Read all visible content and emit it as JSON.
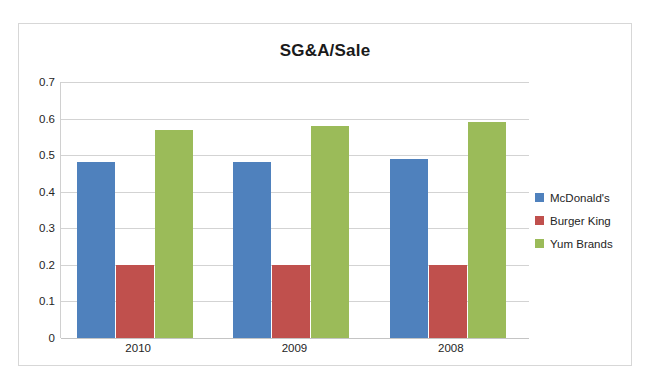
{
  "chart_data": {
    "type": "bar",
    "title": "SG&A/Sale",
    "xlabel": "",
    "ylabel": "",
    "categories": [
      "2010",
      "2009",
      "2008"
    ],
    "series": [
      {
        "name": "McDonald's",
        "color": "#4f81bd",
        "values": [
          0.48,
          0.48,
          0.49
        ]
      },
      {
        "name": "Burger King",
        "color": "#c0504d",
        "values": [
          0.2,
          0.2,
          0.2
        ]
      },
      {
        "name": "Yum Brands",
        "color": "#9bbb59",
        "values": [
          0.57,
          0.58,
          0.59
        ]
      }
    ],
    "ylim": [
      0,
      0.7
    ],
    "ytick_labels": [
      "0.7",
      "0.6",
      "0.5",
      "0.4",
      "0.3",
      "0.2",
      "0.1",
      "0"
    ],
    "ytick_values": [
      0.7,
      0.6,
      0.5,
      0.4,
      0.3,
      0.2,
      0.1,
      0
    ],
    "grid": "horizontal",
    "legend_position": "right",
    "plot_background": "#ffffff",
    "gridline_color": "#d3d3d3",
    "border_color": "#d7d7d7"
  }
}
